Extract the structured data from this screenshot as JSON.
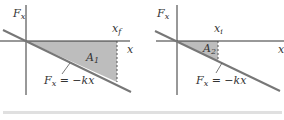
{
  "panels": [
    {
      "y_axis_label": "F",
      "y_axis_sub": "x",
      "x_axis_label": "x",
      "marker_label": "x",
      "marker_sub": "f",
      "area_label": "A",
      "area_sub": "1",
      "line_label_pre": "F",
      "line_label_sub": "x",
      "line_label_post": " = −kx"
    },
    {
      "y_axis_label": "F",
      "y_axis_sub": "x",
      "x_axis_label": "x",
      "marker_label": "x",
      "marker_sub": "i",
      "area_label": "A",
      "area_sub": "2",
      "line_label_pre": "F",
      "line_label_sub": "x",
      "line_label_post": " = −kx"
    }
  ],
  "colors": {
    "axis": "#333333",
    "line": "#777777",
    "shade": "#bdbdbd",
    "bar": "#e0e0e0"
  }
}
